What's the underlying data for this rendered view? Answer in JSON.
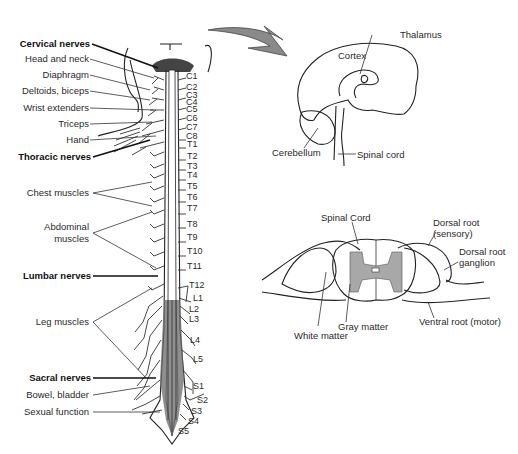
{
  "figure": {
    "spine_labels": {
      "groups": [
        {
          "label": "Cervical nerves",
          "y": 44
        },
        {
          "label": "Thoracic nerves",
          "y": 157
        },
        {
          "label": "Lumbar nerves",
          "y": 276
        },
        {
          "label": "Sacral nerves",
          "y": 378
        }
      ],
      "functions": [
        {
          "label": "Head and neck",
          "y": 59
        },
        {
          "label": "Diaphragm",
          "y": 75
        },
        {
          "label": "Deltoids, biceps",
          "y": 91
        },
        {
          "label": "Wrist extenders",
          "y": 108
        },
        {
          "label": "Triceps",
          "y": 124
        },
        {
          "label": "Hand",
          "y": 140
        },
        {
          "label": "Chest muscles",
          "y": 193
        },
        {
          "label": "Abdominal",
          "y": 227
        },
        {
          "label": "muscles",
          "y": 239
        },
        {
          "label": "Leg muscles",
          "y": 322
        },
        {
          "label": "Bowel, bladder",
          "y": 395
        },
        {
          "label": "Sexual function",
          "y": 412
        }
      ]
    },
    "segments": [
      {
        "label": "C1",
        "x": 186,
        "y": 76
      },
      {
        "label": "C2",
        "x": 186,
        "y": 88
      },
      {
        "label": "C3",
        "x": 186,
        "y": 97
      },
      {
        "label": "C4",
        "x": 186,
        "y": 104
      },
      {
        "label": "C5",
        "x": 186,
        "y": 111
      },
      {
        "label": "C6",
        "x": 186,
        "y": 120
      },
      {
        "label": "C7",
        "x": 186,
        "y": 129
      },
      {
        "label": "C8",
        "x": 186,
        "y": 138
      },
      {
        "label": "T1",
        "x": 187,
        "y": 145
      },
      {
        "label": "T2",
        "x": 187,
        "y": 157
      },
      {
        "label": "T3",
        "x": 187,
        "y": 168
      },
      {
        "label": "T4",
        "x": 187,
        "y": 176
      },
      {
        "label": "T5",
        "x": 187,
        "y": 187
      },
      {
        "label": "T6",
        "x": 187,
        "y": 198
      },
      {
        "label": "T7",
        "x": 187,
        "y": 210
      },
      {
        "label": "T8",
        "x": 187,
        "y": 226
      },
      {
        "label": "T9",
        "x": 187,
        "y": 239
      },
      {
        "label": "T10",
        "x": 187,
        "y": 254
      },
      {
        "label": "T11",
        "x": 187,
        "y": 268
      },
      {
        "label": "T12",
        "x": 189,
        "y": 288
      },
      {
        "label": "L1",
        "x": 193,
        "y": 301
      },
      {
        "label": "L2",
        "x": 189,
        "y": 313
      },
      {
        "label": "L3",
        "x": 189,
        "y": 322
      },
      {
        "label": "L4",
        "x": 190,
        "y": 343
      },
      {
        "label": "L5",
        "x": 193,
        "y": 362
      },
      {
        "label": "S1",
        "x": 193,
        "y": 389
      },
      {
        "label": "S2",
        "x": 197,
        "y": 403
      },
      {
        "label": "S3",
        "x": 191,
        "y": 414
      },
      {
        "label": "S4",
        "x": 188,
        "y": 424
      },
      {
        "label": "S5",
        "x": 178,
        "y": 434
      }
    ],
    "brain_labels": {
      "cortex": "Cortex",
      "thalamus": "Thalamus",
      "cerebellum": "Cerebellum",
      "spinal_cord": "Spinal cord"
    },
    "cross_section_labels": {
      "spinal_cord": "Spinal Cord",
      "dorsal_root": "Dorsal root",
      "dorsal_root_sub": "(sensory)",
      "dorsal_root_ganglion_1": "Dorsal root",
      "dorsal_root_ganglion_2": "ganglion",
      "ventral_root": "Ventral root (motor)",
      "gray_matter": "Gray matter",
      "white_matter": "White matter"
    },
    "colors": {
      "arrow": "#8a8a8a",
      "gray_matter": "#a8a8a8",
      "line": "#222222"
    }
  }
}
